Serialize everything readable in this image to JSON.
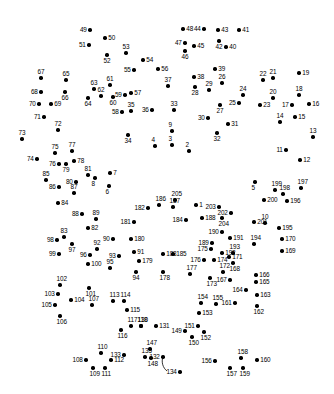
{
  "puzzle": {
    "type": "connect-the-dots",
    "title": "",
    "dot_color": "#000000",
    "label_color": "#000000",
    "background_color": "#ffffff",
    "width": 334,
    "height": 394,
    "dot_count": 205,
    "label_range": "1-205",
    "stroke": {
      "color": "#000000",
      "width": 0.8,
      "path": "M 163 357 C 161 362, 163 368, 167 371"
    },
    "dots": [
      {
        "n": "1",
        "x": 196,
        "y": 205,
        "pos": "lab-r"
      },
      {
        "n": "2",
        "x": 189,
        "y": 151,
        "pos": "lab-t"
      },
      {
        "n": "3",
        "x": 172,
        "y": 145,
        "pos": "lab-t"
      },
      {
        "n": "4",
        "x": 155,
        "y": 146,
        "pos": "lab-t"
      },
      {
        "n": "5",
        "x": 255,
        "y": 182,
        "pos": "lab-b"
      },
      {
        "n": "6",
        "x": 109,
        "y": 186,
        "pos": "lab-b"
      },
      {
        "n": "7",
        "x": 110,
        "y": 173,
        "pos": "lab-r"
      },
      {
        "n": "8",
        "x": 95,
        "y": 178,
        "pos": "lab-b"
      },
      {
        "n": "9",
        "x": 172,
        "y": 131,
        "pos": "lab-t"
      },
      {
        "n": "10",
        "x": 265,
        "y": 223,
        "pos": "lab-t"
      },
      {
        "n": "11",
        "x": 286,
        "y": 150,
        "pos": "lab-l"
      },
      {
        "n": "12",
        "x": 300,
        "y": 160,
        "pos": "lab-r"
      },
      {
        "n": "13",
        "x": 313,
        "y": 137,
        "pos": "lab-t"
      },
      {
        "n": "14",
        "x": 280,
        "y": 122,
        "pos": "lab-t"
      },
      {
        "n": "15",
        "x": 295,
        "y": 117,
        "pos": "lab-r"
      },
      {
        "n": "16",
        "x": 309,
        "y": 104,
        "pos": "lab-r"
      },
      {
        "n": "17",
        "x": 292,
        "y": 105,
        "pos": "lab-l"
      },
      {
        "n": "18",
        "x": 299,
        "y": 95,
        "pos": "lab-t"
      },
      {
        "n": "19",
        "x": 299,
        "y": 73,
        "pos": "lab-r"
      },
      {
        "n": "20",
        "x": 273,
        "y": 98,
        "pos": "lab-t"
      },
      {
        "n": "21",
        "x": 273,
        "y": 78,
        "pos": "lab-t"
      },
      {
        "n": "22",
        "x": 263,
        "y": 80,
        "pos": "lab-t"
      },
      {
        "n": "23",
        "x": 260,
        "y": 105,
        "pos": "lab-r"
      },
      {
        "n": "24",
        "x": 243,
        "y": 95,
        "pos": "lab-t"
      },
      {
        "n": "25",
        "x": 239,
        "y": 103,
        "pos": "lab-l"
      },
      {
        "n": "26",
        "x": 222,
        "y": 83,
        "pos": "lab-t"
      },
      {
        "n": "27",
        "x": 220,
        "y": 105,
        "pos": "lab-b"
      },
      {
        "n": "28",
        "x": 195,
        "y": 87,
        "pos": "lab-b"
      },
      {
        "n": "29",
        "x": 209,
        "y": 90,
        "pos": "lab-t"
      },
      {
        "n": "30",
        "x": 208,
        "y": 118,
        "pos": "lab-l"
      },
      {
        "n": "31",
        "x": 228,
        "y": 124,
        "pos": "lab-r"
      },
      {
        "n": "32",
        "x": 217,
        "y": 133,
        "pos": "lab-b"
      },
      {
        "n": "33",
        "x": 174,
        "y": 110,
        "pos": "lab-t"
      },
      {
        "n": "34",
        "x": 128,
        "y": 135,
        "pos": "lab-b"
      },
      {
        "n": "35",
        "x": 131,
        "y": 111,
        "pos": "lab-t"
      },
      {
        "n": "36",
        "x": 152,
        "y": 110,
        "pos": "lab-l"
      },
      {
        "n": "37",
        "x": 168,
        "y": 86,
        "pos": "lab-t"
      },
      {
        "n": "38",
        "x": 194,
        "y": 77,
        "pos": "lab-r"
      },
      {
        "n": "39",
        "x": 215,
        "y": 69,
        "pos": "lab-r"
      },
      {
        "n": "40",
        "x": 226,
        "y": 47,
        "pos": "lab-r"
      },
      {
        "n": "41",
        "x": 239,
        "y": 30,
        "pos": "lab-r"
      },
      {
        "n": "42",
        "x": 219,
        "y": 41,
        "pos": "lab-b"
      },
      {
        "n": "43",
        "x": 218,
        "y": 30,
        "pos": "lab-r"
      },
      {
        "n": "44",
        "x": 204,
        "y": 29,
        "pos": "lab-l"
      },
      {
        "n": "45",
        "x": 194,
        "y": 46,
        "pos": "lab-r"
      },
      {
        "n": "46",
        "x": 185,
        "y": 51,
        "pos": "lab-b"
      },
      {
        "n": "47",
        "x": 185,
        "y": 43,
        "pos": "lab-l"
      },
      {
        "n": "48",
        "x": 183,
        "y": 29,
        "pos": "lab-r"
      },
      {
        "n": "49",
        "x": 90,
        "y": 30,
        "pos": "lab-l"
      },
      {
        "n": "50",
        "x": 105,
        "y": 38,
        "pos": "lab-r"
      },
      {
        "n": "51",
        "x": 89,
        "y": 45,
        "pos": "lab-l"
      },
      {
        "n": "52",
        "x": 107,
        "y": 55,
        "pos": "lab-b"
      },
      {
        "n": "53",
        "x": 126,
        "y": 53,
        "pos": "lab-t"
      },
      {
        "n": "54",
        "x": 143,
        "y": 60,
        "pos": "lab-r"
      },
      {
        "n": "55",
        "x": 134,
        "y": 70,
        "pos": "lab-l"
      },
      {
        "n": "56",
        "x": 158,
        "y": 69,
        "pos": "lab-r"
      },
      {
        "n": "57",
        "x": 131,
        "y": 93,
        "pos": "lab-r"
      },
      {
        "n": "58",
        "x": 122,
        "y": 112,
        "pos": "lab-l"
      },
      {
        "n": "59",
        "x": 125,
        "y": 95,
        "pos": "lab-l"
      },
      {
        "n": "60",
        "x": 113,
        "y": 97,
        "pos": "lab-b"
      },
      {
        "n": "61",
        "x": 110,
        "y": 85,
        "pos": "lab-t"
      },
      {
        "n": "62",
        "x": 101,
        "y": 96,
        "pos": "lab-t"
      },
      {
        "n": "63",
        "x": 94,
        "y": 89,
        "pos": "lab-t"
      },
      {
        "n": "64",
        "x": 88,
        "y": 98,
        "pos": "lab-b"
      },
      {
        "n": "65",
        "x": 66,
        "y": 80,
        "pos": "lab-t"
      },
      {
        "n": "66",
        "x": 65,
        "y": 92,
        "pos": "lab-b"
      },
      {
        "n": "67",
        "x": 41,
        "y": 78,
        "pos": "lab-t"
      },
      {
        "n": "68",
        "x": 41,
        "y": 92,
        "pos": "lab-l"
      },
      {
        "n": "69",
        "x": 51,
        "y": 104,
        "pos": "lab-r"
      },
      {
        "n": "70",
        "x": 39,
        "y": 104,
        "pos": "lab-l"
      },
      {
        "n": "71",
        "x": 44,
        "y": 117,
        "pos": "lab-l"
      },
      {
        "n": "72",
        "x": 58,
        "y": 130,
        "pos": "lab-t"
      },
      {
        "n": "73",
        "x": 22,
        "y": 139,
        "pos": "lab-t"
      },
      {
        "n": "74",
        "x": 37,
        "y": 159,
        "pos": "lab-l"
      },
      {
        "n": "75",
        "x": 55,
        "y": 153,
        "pos": "lab-t"
      },
      {
        "n": "76",
        "x": 59,
        "y": 164,
        "pos": "lab-l"
      },
      {
        "n": "77",
        "x": 72,
        "y": 151,
        "pos": "lab-t"
      },
      {
        "n": "78",
        "x": 74,
        "y": 161,
        "pos": "lab-r"
      },
      {
        "n": "79",
        "x": 66,
        "y": 164,
        "pos": "lab-b"
      },
      {
        "n": "80",
        "x": 76,
        "y": 182,
        "pos": "lab-l"
      },
      {
        "n": "81",
        "x": 88,
        "y": 175,
        "pos": "lab-t"
      },
      {
        "n": "82",
        "x": 88,
        "y": 228,
        "pos": "lab-r"
      },
      {
        "n": "83",
        "x": 64,
        "y": 237,
        "pos": "lab-t"
      },
      {
        "n": "84",
        "x": 58,
        "y": 203,
        "pos": "lab-r"
      },
      {
        "n": "85",
        "x": 46,
        "y": 180,
        "pos": "lab-t"
      },
      {
        "n": "86",
        "x": 59,
        "y": 187,
        "pos": "lab-l"
      },
      {
        "n": "87",
        "x": 74,
        "y": 193,
        "pos": "lab-t"
      },
      {
        "n": "88",
        "x": 82,
        "y": 214,
        "pos": "lab-l"
      },
      {
        "n": "89",
        "x": 96,
        "y": 219,
        "pos": "lab-t"
      },
      {
        "n": "90",
        "x": 113,
        "y": 239,
        "pos": "lab-l"
      },
      {
        "n": "91",
        "x": 134,
        "y": 252,
        "pos": "lab-r"
      },
      {
        "n": "92",
        "x": 97,
        "y": 249,
        "pos": "lab-t"
      },
      {
        "n": "93",
        "x": 119,
        "y": 256,
        "pos": "lab-l"
      },
      {
        "n": "94",
        "x": 136,
        "y": 272,
        "pos": "lab-b"
      },
      {
        "n": "95",
        "x": 110,
        "y": 268,
        "pos": "lab-t"
      },
      {
        "n": "96",
        "x": 90,
        "y": 255,
        "pos": "lab-l"
      },
      {
        "n": "97",
        "x": 72,
        "y": 244,
        "pos": "lab-b"
      },
      {
        "n": "98",
        "x": 57,
        "y": 240,
        "pos": "lab-l"
      },
      {
        "n": "99",
        "x": 59,
        "y": 254,
        "pos": "lab-l"
      },
      {
        "n": "100",
        "x": 88,
        "y": 264,
        "pos": "lab-r"
      },
      {
        "n": "101",
        "x": 89,
        "y": 288,
        "pos": "lab-b"
      },
      {
        "n": "102",
        "x": 60,
        "y": 285,
        "pos": "lab-t"
      },
      {
        "n": "103",
        "x": 58,
        "y": 294,
        "pos": "lab-l"
      },
      {
        "n": "104",
        "x": 71,
        "y": 300,
        "pos": "lab-r"
      },
      {
        "n": "105",
        "x": 55,
        "y": 305,
        "pos": "lab-l"
      },
      {
        "n": "106",
        "x": 60,
        "y": 316,
        "pos": "lab-b"
      },
      {
        "n": "107",
        "x": 92,
        "y": 305,
        "pos": "lab-t"
      },
      {
        "n": "108",
        "x": 86,
        "y": 360,
        "pos": "lab-l"
      },
      {
        "n": "109",
        "x": 93,
        "y": 368,
        "pos": "lab-b"
      },
      {
        "n": "110",
        "x": 101,
        "y": 353,
        "pos": "lab-t"
      },
      {
        "n": "111",
        "x": 105,
        "y": 368,
        "pos": "lab-b"
      },
      {
        "n": "112",
        "x": 111,
        "y": 360,
        "pos": "lab-r"
      },
      {
        "n": "113",
        "x": 113,
        "y": 301,
        "pos": "lab-t"
      },
      {
        "n": "114",
        "x": 124,
        "y": 301,
        "pos": "lab-t"
      },
      {
        "n": "115",
        "x": 127,
        "y": 310,
        "pos": "lab-r"
      },
      {
        "n": "116",
        "x": 121,
        "y": 330,
        "pos": "lab-b"
      },
      {
        "n": "117",
        "x": 131,
        "y": 326,
        "pos": "lab-t"
      },
      {
        "n": "118",
        "x": 141,
        "y": 326,
        "pos": "lab-t"
      },
      {
        "n": "130",
        "x": 141,
        "y": 326,
        "pos": "lab-t"
      },
      {
        "n": "131",
        "x": 156,
        "y": 326,
        "pos": "lab-r"
      },
      {
        "n": "132",
        "x": 163,
        "y": 357,
        "pos": "lab-l"
      },
      {
        "n": "133",
        "x": 124,
        "y": 355,
        "pos": "lab-l"
      },
      {
        "n": "134",
        "x": 180,
        "y": 372,
        "pos": "lab-l"
      },
      {
        "n": "135",
        "x": 145,
        "y": 357,
        "pos": "lab-t"
      },
      {
        "n": "147",
        "x": 150,
        "y": 349,
        "pos": "lab-t"
      },
      {
        "n": "148",
        "x": 151,
        "y": 358,
        "pos": "lab-b"
      },
      {
        "n": "149",
        "x": 185,
        "y": 331,
        "pos": "lab-l"
      },
      {
        "n": "150",
        "x": 192,
        "y": 337,
        "pos": "lab-b"
      },
      {
        "n": "151",
        "x": 198,
        "y": 326,
        "pos": "lab-l"
      },
      {
        "n": "152",
        "x": 204,
        "y": 332,
        "pos": "lab-b"
      },
      {
        "n": "153",
        "x": 199,
        "y": 313,
        "pos": "lab-r"
      },
      {
        "n": "154",
        "x": 201,
        "y": 303,
        "pos": "lab-t"
      },
      {
        "n": "155",
        "x": 216,
        "y": 304,
        "pos": "lab-t"
      },
      {
        "n": "156",
        "x": 215,
        "y": 361,
        "pos": "lab-l"
      },
      {
        "n": "157",
        "x": 230,
        "y": 368,
        "pos": "lab-b"
      },
      {
        "n": "158",
        "x": 241,
        "y": 358,
        "pos": "lab-t"
      },
      {
        "n": "159",
        "x": 243,
        "y": 368,
        "pos": "lab-b"
      },
      {
        "n": "160",
        "x": 257,
        "y": 360,
        "pos": "lab-r"
      },
      {
        "n": "161",
        "x": 235,
        "y": 303,
        "pos": "lab-l"
      },
      {
        "n": "162",
        "x": 257,
        "y": 306,
        "pos": "lab-b"
      },
      {
        "n": "163",
        "x": 257,
        "y": 295,
        "pos": "lab-r"
      },
      {
        "n": "164",
        "x": 246,
        "y": 290,
        "pos": "lab-l"
      },
      {
        "n": "165",
        "x": 256,
        "y": 282,
        "pos": "lab-r"
      },
      {
        "n": "166",
        "x": 256,
        "y": 275,
        "pos": "lab-r"
      },
      {
        "n": "167",
        "x": 230,
        "y": 280,
        "pos": "lab-l"
      },
      {
        "n": "168",
        "x": 233,
        "y": 263,
        "pos": "lab-b"
      },
      {
        "n": "169",
        "x": 282,
        "y": 251,
        "pos": "lab-r"
      },
      {
        "n": "170",
        "x": 282,
        "y": 239,
        "pos": "lab-r"
      },
      {
        "n": "171",
        "x": 229,
        "y": 257,
        "pos": "lab-r"
      },
      {
        "n": "172",
        "x": 223,
        "y": 272,
        "pos": "lab-t"
      },
      {
        "n": "173",
        "x": 210,
        "y": 278,
        "pos": "lab-b"
      },
      {
        "n": "174",
        "x": 214,
        "y": 260,
        "pos": "lab-r"
      },
      {
        "n": "175",
        "x": 211,
        "y": 249,
        "pos": "lab-l"
      },
      {
        "n": "176",
        "x": 204,
        "y": 260,
        "pos": "lab-l"
      },
      {
        "n": "177",
        "x": 190,
        "y": 274,
        "pos": "lab-t"
      },
      {
        "n": "178",
        "x": 163,
        "y": 272,
        "pos": "lab-b"
      },
      {
        "n": "179",
        "x": 139,
        "y": 261,
        "pos": "lab-r"
      },
      {
        "n": "180",
        "x": 131,
        "y": 239,
        "pos": "lab-r"
      },
      {
        "n": "181",
        "x": 134,
        "y": 222,
        "pos": "lab-l"
      },
      {
        "n": "182",
        "x": 148,
        "y": 208,
        "pos": "lab-l"
      },
      {
        "n": "183",
        "x": 163,
        "y": 254,
        "pos": "lab-r"
      },
      {
        "n": "184",
        "x": 186,
        "y": 220,
        "pos": "lab-l"
      },
      {
        "n": "185",
        "x": 173,
        "y": 254,
        "pos": "lab-r"
      },
      {
        "n": "186",
        "x": 159,
        "y": 205,
        "pos": "lab-t"
      },
      {
        "n": "187",
        "x": 173,
        "y": 207,
        "pos": "lab-t"
      },
      {
        "n": "188",
        "x": 202,
        "y": 218,
        "pos": "lab-r"
      },
      {
        "n": "189",
        "x": 212,
        "y": 243,
        "pos": "lab-l"
      },
      {
        "n": "190",
        "x": 222,
        "y": 232,
        "pos": "lab-l"
      },
      {
        "n": "191",
        "x": 230,
        "y": 238,
        "pos": "lab-r"
      },
      {
        "n": "192",
        "x": 222,
        "y": 253,
        "pos": "lab-r"
      },
      {
        "n": "193",
        "x": 233,
        "y": 253,
        "pos": "lab-t"
      },
      {
        "n": "194",
        "x": 254,
        "y": 244,
        "pos": "lab-t"
      },
      {
        "n": "195",
        "x": 279,
        "y": 228,
        "pos": "lab-r"
      },
      {
        "n": "196",
        "x": 287,
        "y": 201,
        "pos": "lab-r"
      },
      {
        "n": "197",
        "x": 301,
        "y": 188,
        "pos": "lab-t"
      },
      {
        "n": "198",
        "x": 283,
        "y": 194,
        "pos": "lab-t"
      },
      {
        "n": "199",
        "x": 275,
        "y": 190,
        "pos": "lab-t"
      },
      {
        "n": "200",
        "x": 264,
        "y": 200,
        "pos": "lab-r"
      },
      {
        "n": "201",
        "x": 254,
        "y": 222,
        "pos": "lab-r"
      },
      {
        "n": "202",
        "x": 231,
        "y": 213,
        "pos": "lab-l"
      },
      {
        "n": "203",
        "x": 219,
        "y": 207,
        "pos": "lab-l"
      },
      {
        "n": "204",
        "x": 222,
        "y": 218,
        "pos": "lab-b"
      },
      {
        "n": "205",
        "x": 175,
        "y": 200,
        "pos": "lab-t"
      }
    ]
  }
}
